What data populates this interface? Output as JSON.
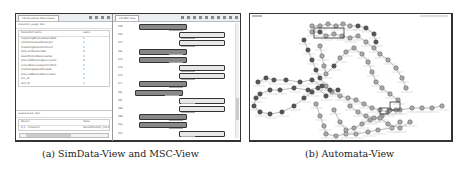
{
  "figure_a": {
    "caption": "(a) SimData-View and MSC-View",
    "simdata_view": {
      "tab_title": "CSI Simulation Data Viewer",
      "transition_label": "transition_stage: 360",
      "table_headers": [
        "transition name",
        "value"
      ],
      "rows": [
        {
          "name": "mstartingBlockadeSendAid",
          "value": "1"
        },
        {
          "name": "completeLatestDesteper",
          "value": "1"
        },
        {
          "name": "mstartingtoLockConnect",
          "value": "1"
        },
        {
          "name": "loop_turbLockedVal",
          "value": "0"
        },
        {
          "name": "stateBlockedSuccessVal",
          "value": "1"
        },
        {
          "name": "proceedBlockingSuccessful",
          "value": "0"
        },
        {
          "name": "servedSuccessSyncConflict",
          "value": "1"
        },
        {
          "name": "mstartingstateBlockade",
          "value": "1"
        },
        {
          "name": "proceedBlockedSuccessful",
          "value": "1"
        },
        {
          "name": "sec_id",
          "value": "1"
        },
        {
          "name": "slot_id",
          "value": "1"
        }
      ],
      "queue_label": "Queue state: 360",
      "queue_headers": [
        "Queue",
        "Value"
      ],
      "queue_rows": [
        {
          "name": "q 1 - (channel)",
          "value": "lateralPosition_req.data"
        }
      ]
    },
    "msc_view": {
      "tab_title": "CSI MSC View",
      "toolbar_icons": [
        "back-icon",
        "forward-icon",
        "stop-icon",
        "page-icon",
        "edit-icon",
        "zoom-in-icon",
        "zoom-out-icon",
        "filter-icon",
        "pin-icon",
        "menu-icon"
      ],
      "rows": [
        {
          "step": "358",
          "side": "left",
          "label": "LateralBlockHandler_req.data",
          "dark": true
        },
        {
          "step": "359",
          "side": "right",
          "label": "LateralPosition_req.data",
          "dark": false
        },
        {
          "step": "370",
          "side": "right",
          "label": "LateralPosition_req.data",
          "dark": false
        },
        {
          "step": "380",
          "side": "left",
          "label": "ProceedBlockHandler_req.data",
          "dark": true
        },
        {
          "step": "373",
          "side": "left",
          "label": "LateralBlockHandler_req.data",
          "dark": true
        },
        {
          "step": "378",
          "side": "right",
          "label": "LateralPosition_req.data",
          "dark": false
        },
        {
          "step": "373",
          "side": "right",
          "label": "LateralPosition_req.data",
          "dark": false
        },
        {
          "step": "377",
          "side": "left",
          "label": "LateralBlockHandler_req.data",
          "dark": true
        },
        {
          "step": "381",
          "side": "left",
          "label": "ProceedBlockingSuccess_req.data",
          "dark": true
        },
        {
          "step": "384",
          "side": "right",
          "label": "LateralBlocking_Success_req.data",
          "dark": false
        },
        {
          "step": "386",
          "side": "right",
          "label": "LateralBlocking_Success_req.data",
          "dark": false
        },
        {
          "step": "388",
          "side": "left",
          "label": "ProceedBlocking_Success_req.data",
          "dark": true
        },
        {
          "step": "390",
          "side": "left",
          "label": "LateralBlockHandler_req.data",
          "dark": true
        },
        {
          "step": "394",
          "side": "right",
          "label": "LateralPosition_req.data",
          "dark": false
        }
      ]
    }
  },
  "figure_b": {
    "caption": "(b) Automata-View",
    "tab_title": "Automata"
  }
}
